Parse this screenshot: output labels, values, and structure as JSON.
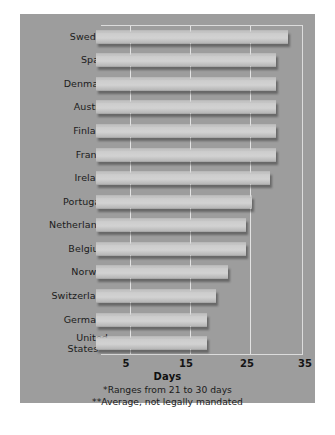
{
  "chart_data": {
    "type": "bar",
    "orientation": "horizontal",
    "title": "",
    "xlabel": "Days",
    "ylabel": "",
    "xlim": [
      0,
      35.5
    ],
    "xticks": [
      5,
      15,
      25,
      35
    ],
    "grid": true,
    "legend": null,
    "categories": [
      "Sweden",
      "Spain",
      "Denmark",
      "Austria",
      "Finland",
      "France",
      "Ireland",
      "Portugal*",
      "Netherlands",
      "Belgium",
      "Norway",
      "Switzerland",
      "Germany",
      "United\nStates**"
    ],
    "values": [
      32,
      30,
      30,
      30,
      30,
      30,
      29,
      26,
      25,
      25,
      22,
      20,
      18.5,
      18.5
    ],
    "annotations": [
      "*Ranges from 21 to 30 days",
      "**Average, not legally mandated"
    ]
  },
  "axis": {
    "title": "Days",
    "ticks": [
      "5",
      "15",
      "25",
      "35"
    ]
  },
  "footnotes": {
    "one": "*Ranges from 21 to 30 days",
    "two": "**Average, not legally mandated"
  },
  "caption": {
    "text": ""
  },
  "colors": {
    "panel_background": "#9d9d9d",
    "bar_fill": "#cdcdcd",
    "gridline": "#e2e2e2",
    "text": "#1b1b1b",
    "page_background": "#ffffff"
  }
}
